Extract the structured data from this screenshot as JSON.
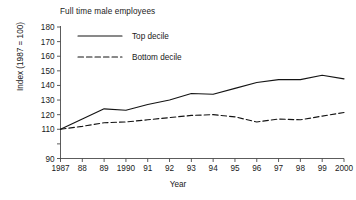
{
  "chart_data": {
    "type": "line",
    "title": "Full time male employees",
    "xlabel": "Year",
    "ylabel": "Index (1987 = 100)",
    "grid": false,
    "legend_position": "top-left-inside",
    "x": [
      1987,
      1988,
      1989,
      1990,
      1991,
      1992,
      1993,
      1994,
      1995,
      1996,
      1997,
      1998,
      1999,
      2000
    ],
    "categories": [
      "1987",
      "88",
      "89",
      "1990",
      "91",
      "92",
      "93",
      "94",
      "95",
      "96",
      "97",
      "98",
      "99",
      "2000"
    ],
    "ylim": [
      90,
      180
    ],
    "yticks": [
      90,
      100,
      110,
      120,
      130,
      140,
      150,
      160,
      170,
      180
    ],
    "ytick_labels": [
      "90",
      "",
      "110",
      "120",
      "130",
      "140",
      "150",
      "160",
      "170",
      "180"
    ],
    "series": [
      {
        "name": "Top decile",
        "style": "solid",
        "color": "#141414",
        "values": [
          110,
          117,
          124,
          123,
          127,
          130,
          134.5,
          134,
          138,
          142,
          144,
          144,
          147,
          144.5
        ]
      },
      {
        "name": "Bottom decile",
        "style": "dashed",
        "color": "#141414",
        "values": [
          110,
          112,
          114.5,
          115,
          116.5,
          118,
          119.5,
          120,
          118.5,
          115,
          117,
          116.5,
          119,
          121.5
        ]
      }
    ]
  },
  "legend": {
    "entries": [
      {
        "label": "Top decile",
        "style": "solid"
      },
      {
        "label": "Bottom decile",
        "style": "dashed"
      }
    ]
  }
}
